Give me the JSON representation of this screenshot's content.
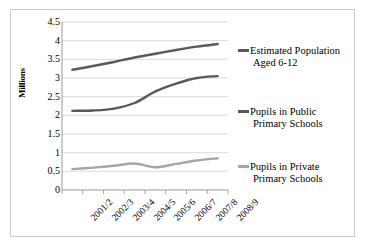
{
  "chart_data": {
    "type": "line",
    "title": "",
    "xlabel": "",
    "ylabel": "Millions",
    "categories": [
      "2001/2",
      "2002/3",
      "2003/4",
      "2004/5",
      "2005/6",
      "2006/7",
      "2007/8",
      "2008/9"
    ],
    "ylim": [
      0,
      4.5
    ],
    "yticks": [
      "0",
      "0.5",
      "1",
      "1.5",
      "2",
      "2.5",
      "3",
      "3.5",
      "4",
      "4.5"
    ],
    "ytick_values": [
      0,
      0.5,
      1,
      1.5,
      2,
      2.5,
      3,
      3.5,
      4,
      4.5
    ],
    "grid": "horizontal",
    "legend_position": "right",
    "series": [
      {
        "name": "Estimated Population Aged 6-12",
        "name_line1": "Estimated Population",
        "name_line2": "Aged 6-12",
        "color": "#595959",
        "values": [
          3.22,
          3.32,
          3.43,
          3.55,
          3.65,
          3.75,
          3.84,
          3.91
        ]
      },
      {
        "name": "Pupils in Public Primary Schools",
        "name_line1": "Pupils in Public",
        "name_line2": "Primary Schools",
        "color": "#595959",
        "values": [
          2.12,
          2.13,
          2.18,
          2.33,
          2.64,
          2.85,
          3.0,
          3.05
        ]
      },
      {
        "name": "Pupils in Private Primary Schools",
        "name_line1": "Pupils in Private",
        "name_line2": "Primary Schools",
        "color": "#a6a6a6",
        "values": [
          0.56,
          0.6,
          0.65,
          0.71,
          0.61,
          0.7,
          0.79,
          0.85
        ]
      }
    ]
  },
  "figure": {
    "border_color": "#c9c9c9",
    "background": "#ffffff",
    "grid_color": "#d0d0d0",
    "axis_color": "#9a9a9a"
  }
}
